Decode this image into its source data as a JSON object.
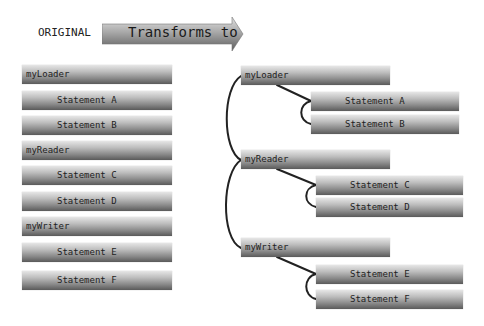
{
  "header": {
    "original_label": "ORIGINAL",
    "arrow_label": "Transforms to"
  },
  "left_column": [
    {
      "label": "myLoader",
      "kind": "header"
    },
    {
      "label": "Statement A",
      "kind": "statement"
    },
    {
      "label": "Statement B",
      "kind": "statement"
    },
    {
      "label": "myReader",
      "kind": "header"
    },
    {
      "label": "Statement C",
      "kind": "statement"
    },
    {
      "label": "Statement D",
      "kind": "statement"
    },
    {
      "label": "myWriter",
      "kind": "header"
    },
    {
      "label": "Statement E",
      "kind": "statement"
    },
    {
      "label": "Statement F",
      "kind": "statement"
    }
  ],
  "right_tree": [
    {
      "label": "myLoader",
      "children": [
        "Statement A",
        "Statement B"
      ]
    },
    {
      "label": "myReader",
      "children": [
        "Statement C",
        "Statement D"
      ]
    },
    {
      "label": "myWriter",
      "children": [
        "Statement E",
        "Statement F"
      ]
    }
  ],
  "colors": {
    "box_gradient_top": "#e6e6e6",
    "box_gradient_bottom": "#5a5a5a",
    "connector": "#222222",
    "background": "#ffffff"
  }
}
